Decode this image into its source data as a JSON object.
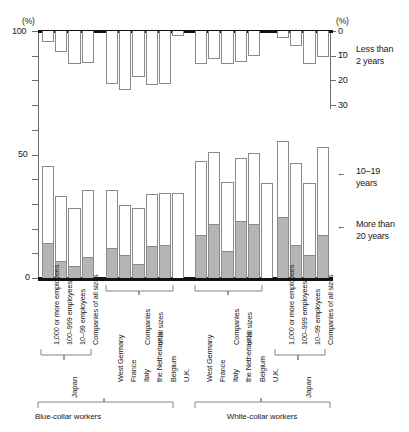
{
  "chart_data": {
    "type": "bar",
    "title": "",
    "subtitle": "",
    "orientation": "dual-axis vertical stacked bars",
    "left_axis": {
      "label": "(%)",
      "ticks": [
        0,
        10,
        20,
        30,
        40,
        50,
        60,
        70,
        80,
        90,
        100
      ],
      "labeled_ticks": [
        0,
        50,
        100
      ],
      "min": 0,
      "max": 100
    },
    "right_axis": {
      "label": "(%)",
      "ticks": [
        0,
        10,
        20,
        30
      ],
      "labeled_ticks": [
        0,
        10,
        20,
        30
      ],
      "min": 0,
      "max": 30,
      "direction": "downward from 100% line"
    },
    "legend": [
      {
        "key": "less_than_2_years",
        "label_line1": "Less than",
        "label_line2": "2 years",
        "style": "outline bar hanging from top, right axis"
      },
      {
        "key": "10_19_years",
        "label_line1": "10–19",
        "label_line2": "years",
        "style": "white segment"
      },
      {
        "key": "more_than_20_years",
        "label_line1": "More than",
        "label_line2": "20 years",
        "style": "gray segment"
      }
    ],
    "group_labels": [
      "Blue-collar workers",
      "White-collar workers"
    ],
    "country_brackets": [
      "Japan",
      "Japan"
    ],
    "groups": [
      {
        "name": "Blue-collar workers",
        "country": "Japan",
        "bracketed": true,
        "categories": [
          "1,000 or more employees",
          "100–999 employees",
          "10–99 employees",
          "Companies of all sizes"
        ],
        "less_than_2_years": [
          4.5,
          8.5,
          13.5,
          13.0
        ],
        "more_than_20_years": [
          14.0,
          7.0,
          5.0,
          8.5
        ],
        "10_19_years": [
          31.5,
          26.0,
          23.5,
          27.0
        ],
        "total_10plus": [
          45.5,
          33.0,
          28.5,
          35.5
        ]
      },
      {
        "name": "Blue-collar workers",
        "country": "Europe",
        "bracketed": false,
        "categories": [
          "West Germany",
          "France",
          "Italy",
          "the Netherlands",
          "Belgium",
          "U.K."
        ],
        "group_note": "Companies of all sizes",
        "less_than_2_years": [
          21.5,
          24.0,
          18.5,
          22.0,
          21.5,
          2.0
        ],
        "more_than_20_years": [
          12.0,
          9.5,
          5.5,
          13.0,
          13.5,
          0.0
        ],
        "10_19_years": [
          23.5,
          20.0,
          23.0,
          21.0,
          21.0,
          34.5
        ],
        "total_10plus": [
          35.5,
          29.5,
          28.5,
          34.0,
          34.5,
          34.5
        ]
      },
      {
        "name": "White-collar workers",
        "country": "Europe",
        "bracketed": false,
        "categories": [
          "West Germany",
          "France",
          "Italy",
          "the Netherlands",
          "Belgium",
          "U.K."
        ],
        "group_note": "Companies of all sizes",
        "less_than_2_years": [
          13.5,
          11.5,
          13.5,
          12.5,
          10.0,
          0.0
        ],
        "more_than_20_years": [
          17.5,
          22.0,
          11.0,
          23.0,
          22.0,
          0.0
        ],
        "10_19_years": [
          30.0,
          29.0,
          28.0,
          25.5,
          28.5,
          38.5
        ],
        "total_10plus": [
          47.5,
          51.0,
          39.0,
          48.5,
          50.5,
          38.5
        ]
      },
      {
        "name": "White-collar workers",
        "country": "Japan",
        "bracketed": true,
        "categories": [
          "1,000 or more employees",
          "100–999 employees",
          "10–99 employees",
          "Companies of all sizes"
        ],
        "less_than_2_years": [
          3.0,
          6.0,
          13.5,
          10.5
        ],
        "more_than_20_years": [
          24.5,
          13.5,
          9.5,
          17.5
        ],
        "10_19_years": [
          31.0,
          33.0,
          29.0,
          35.5
        ],
        "total_10plus": [
          55.5,
          46.5,
          38.5,
          53.0
        ]
      }
    ]
  },
  "axes": {
    "left_unit": "(%)",
    "right_unit": "(%)",
    "left_labels": {
      "top": "100",
      "mid": "50",
      "bottom": "0"
    },
    "right_labels": {
      "t0": "0",
      "t10": "10",
      "t20": "20",
      "t30": "30"
    }
  },
  "legend_text": {
    "less_than_2_years_l1": "Less than",
    "less_than_2_years_l2": "2 years",
    "ten_nineteen_l1": "10–19",
    "ten_nineteen_l2": "years",
    "more_than_20_l1": "More than",
    "more_than_20_l2": "20 years"
  },
  "categories": {
    "jp_blue": [
      "1,000 or more employees",
      "100–999 employees",
      "10–99 employees",
      "Companies of all sizes"
    ],
    "eu_blue": [
      "West Germany",
      "France",
      "Italy",
      "the Netherlands",
      "Belgium",
      "U.K."
    ],
    "eu_white": [
      "West Germany",
      "France",
      "Italy",
      "the Netherlands",
      "Belgium",
      "U.K."
    ],
    "jp_white": [
      "1,000 or more employees",
      "100–999 employees",
      "10–99 employees",
      "Companies of all sizes"
    ],
    "eu_blue_note_l1": "Companies",
    "eu_blue_note_l2": "of all sizes",
    "eu_white_note_l1": "Companies",
    "eu_white_note_l2": "of all sizes"
  },
  "brackets": {
    "japan_blue": "Japan",
    "japan_white": "Japan",
    "blue_collar": "Blue-collar workers",
    "white_collar": "White-collar workers"
  }
}
